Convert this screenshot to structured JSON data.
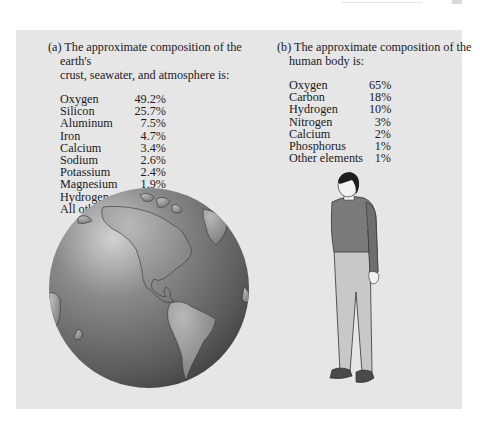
{
  "page": {
    "background": "#ffffff",
    "panel_color": "#e6e6e6"
  },
  "section_a": {
    "label": "(a)",
    "heading_line1": "The approximate composition of the earth's",
    "heading_line2": "crust, seawater, and atmosphere is:",
    "items": [
      {
        "name": "Oxygen",
        "pct": "49.2%"
      },
      {
        "name": "Silicon",
        "pct": "25.7%"
      },
      {
        "name": "Aluminum",
        "pct": "7.5%"
      },
      {
        "name": "Iron",
        "pct": "4.7%"
      },
      {
        "name": "Calcium",
        "pct": "3.4%"
      },
      {
        "name": "Sodium",
        "pct": "2.6%"
      },
      {
        "name": "Potassium",
        "pct": "2.4%"
      },
      {
        "name": "Magnesium",
        "pct": "1.9%"
      },
      {
        "name": "Hydrogen",
        "pct": "0.9%"
      },
      {
        "name": "All others",
        "pct": "1.7%"
      }
    ],
    "illustration": "globe-americas-icon"
  },
  "section_b": {
    "label": "(b)",
    "heading_line1": "The approximate composition of the",
    "heading_line2": "human body is:",
    "items": [
      {
        "name": "Oxygen",
        "pct": "65%"
      },
      {
        "name": "Carbon",
        "pct": "18%"
      },
      {
        "name": "Hydrogen",
        "pct": "10%"
      },
      {
        "name": "Nitrogen",
        "pct": "3%"
      },
      {
        "name": "Calcium",
        "pct": "2%"
      },
      {
        "name": "Phosphorus",
        "pct": "1%"
      },
      {
        "name": "Other elements",
        "pct": "1%"
      }
    ],
    "illustration": "standing-person-icon"
  }
}
